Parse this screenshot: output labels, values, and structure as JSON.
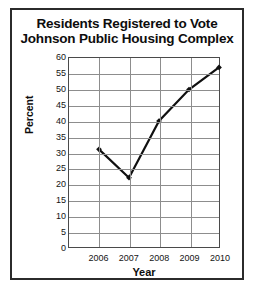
{
  "chart_data": {
    "type": "line",
    "title": "Residents Registered to Vote Johnson Public Housing Complex",
    "title_lines": [
      "Residents Registered to Vote",
      "Johnson Public Housing Complex"
    ],
    "xlabel": "Year",
    "ylabel": "Percent",
    "categories": [
      "2006",
      "2007",
      "2008",
      "2009",
      "2010"
    ],
    "values": [
      31,
      22,
      40,
      50,
      57
    ],
    "series": [
      {
        "name": "Percent registered",
        "values": [
          31,
          22,
          40,
          50,
          57
        ]
      }
    ],
    "ylim": [
      0,
      60
    ],
    "ytick_step": 5,
    "yticks": [
      "60",
      "55",
      "50",
      "45",
      "40",
      "35",
      "30",
      "25",
      "20",
      "15",
      "10",
      "5",
      "0"
    ],
    "grid": "both",
    "legend": "none",
    "line_color": "#101010",
    "marker": "diamond",
    "marker_color": "#101010",
    "grid_color": "#8d8d8d",
    "frame_color": "#2b2b2b"
  }
}
